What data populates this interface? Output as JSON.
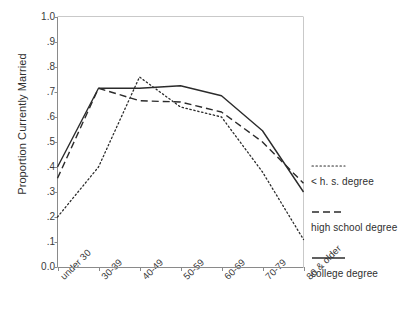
{
  "chart_data": {
    "type": "line",
    "title": "",
    "xlabel": "",
    "ylabel": "Proportion Currently Married",
    "categories": [
      "under 30",
      "30-39",
      "40-49",
      "50-59",
      "60-69",
      "70-79",
      "80 & older"
    ],
    "ylim": [
      0.0,
      1.0
    ],
    "ytick_labels": [
      "1.0",
      ".9",
      ".8",
      ".7",
      ".6",
      ".5",
      ".4",
      ".3",
      ".2",
      ".1",
      "0.0"
    ],
    "ytick_values": [
      1.0,
      0.9,
      0.8,
      0.7,
      0.6,
      0.5,
      0.4,
      0.3,
      0.2,
      0.1,
      0.0
    ],
    "grid": false,
    "legend_position": "right",
    "series": [
      {
        "name": "< h. s. degree",
        "style": "dotted",
        "color": "#2b2b2b",
        "values": [
          0.2,
          0.4,
          0.76,
          0.64,
          0.6,
          0.38,
          0.11
        ]
      },
      {
        "name": "high school degree",
        "style": "dashed",
        "color": "#2b2b2b",
        "values": [
          0.355,
          0.715,
          0.665,
          0.66,
          0.62,
          0.5,
          0.335
        ]
      },
      {
        "name": "college degree",
        "style": "solid",
        "color": "#2b2b2b",
        "values": [
          0.4,
          0.715,
          0.715,
          0.725,
          0.685,
          0.545,
          0.3
        ]
      }
    ]
  },
  "axes": {
    "y_title": "Proportion Currently Married"
  },
  "legend": {
    "entries": [
      {
        "label": "< h. s. degree",
        "style": "dotted"
      },
      {
        "label": "high school degree",
        "style": "dashed"
      },
      {
        "label": "college degree",
        "style": "solid"
      }
    ]
  }
}
